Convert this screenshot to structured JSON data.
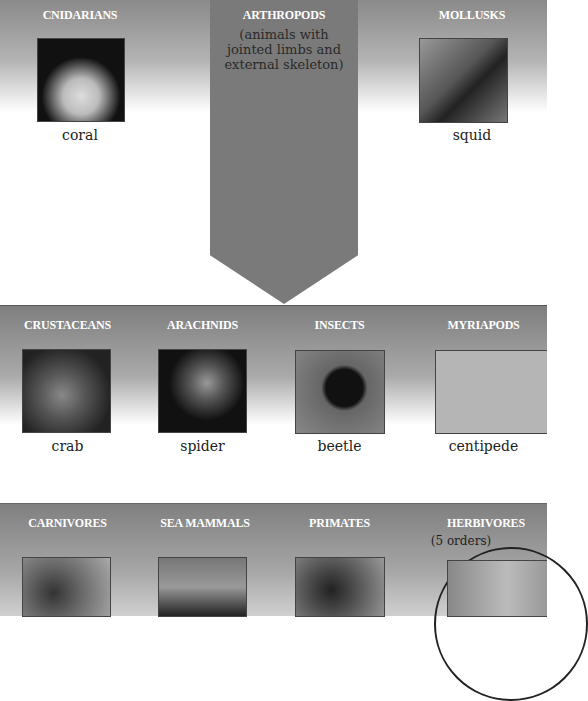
{
  "top_row": {
    "cnidarians": {
      "title": "CNIDARIANS",
      "example": "coral"
    },
    "arthropods": {
      "title": "ARTHROPODS",
      "subtitle_lines": [
        "(animals with",
        "jointed limbs and",
        "external skeleton)"
      ]
    },
    "mollusks": {
      "title": "MOLLUSKS",
      "example": "squid"
    }
  },
  "arthropod_groups": [
    {
      "title": "CRUSTACEANS",
      "example": "crab"
    },
    {
      "title": "ARACHNIDS",
      "example": "spider"
    },
    {
      "title": "INSECTS",
      "example": "beetle"
    },
    {
      "title": "MYRIAPODS",
      "example": "centipede"
    }
  ],
  "mammal_groups": [
    {
      "title": "CARNIVORES"
    },
    {
      "title": "SEA MAMMALS"
    },
    {
      "title": "PRIMATES"
    },
    {
      "title": "HERBIVORES",
      "subtitle": "(5 orders)"
    }
  ],
  "colors": {
    "band_dark": "#808080",
    "arrow": "#7a7a7a",
    "header_text": "#ffffff"
  }
}
